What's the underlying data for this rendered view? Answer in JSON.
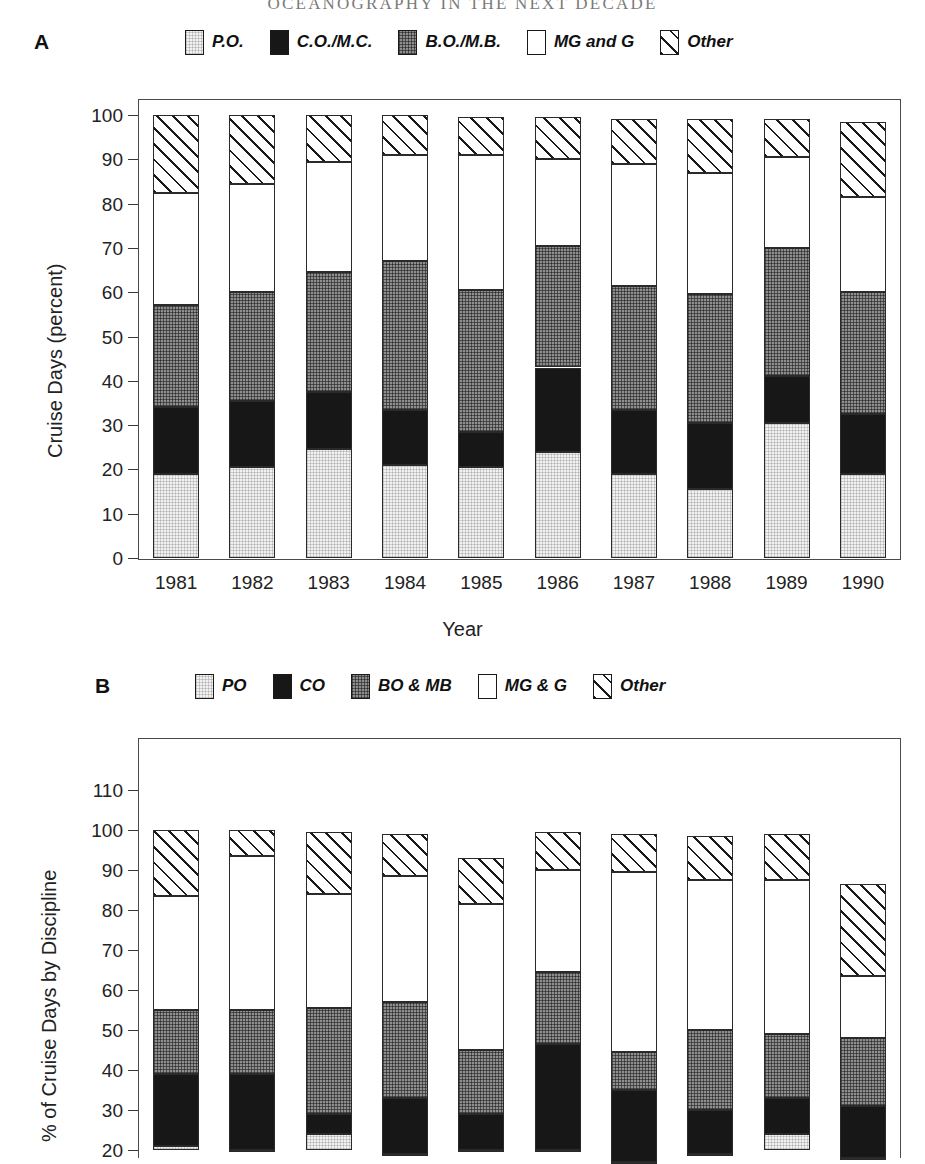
{
  "running_head": "OCEANOGRAPHY IN THE NEXT DECADE",
  "panels": [
    {
      "letter": "A",
      "legend": [
        {
          "label": "P.O.",
          "fill": "po"
        },
        {
          "label": "C.O./M.C.",
          "fill": "co"
        },
        {
          "label": "B.O./M.B.",
          "fill": "bomb"
        },
        {
          "label": "MG and G",
          "fill": "mgg"
        },
        {
          "label": "Other",
          "fill": "other"
        }
      ],
      "ylabel": "Cruise Days (percent)",
      "xlabel": "Year",
      "chart_data": {
        "type": "bar",
        "subtype": "stacked",
        "title": "",
        "xlabel": "Year",
        "ylabel": "Cruise Days (percent)",
        "ylim": [
          0,
          100
        ],
        "yticks": [
          0,
          10,
          20,
          30,
          40,
          50,
          60,
          70,
          80,
          90,
          100
        ],
        "grid": false,
        "legend_position": "top",
        "categories": [
          "1981",
          "1982",
          "1983",
          "1984",
          "1985",
          "1986",
          "1987",
          "1988",
          "1989",
          "1990"
        ],
        "series": [
          {
            "name": "P.O.",
            "values": [
              19.0,
              20.5,
              24.5,
              21.0,
              20.5,
              24.0,
              19.0,
              15.5,
              30.5,
              19.0
            ]
          },
          {
            "name": "C.O./M.C.",
            "values": [
              15.0,
              15.0,
              13.0,
              12.5,
              8.0,
              19.0,
              14.5,
              15.0,
              10.5,
              13.5
            ]
          },
          {
            "name": "B.O./M.B.",
            "values": [
              23.0,
              24.5,
              27.0,
              33.5,
              32.0,
              27.5,
              28.0,
              29.0,
              29.0,
              27.5
            ]
          },
          {
            "name": "MG and G",
            "values": [
              25.5,
              24.5,
              25.0,
              24.0,
              30.5,
              19.5,
              27.5,
              27.5,
              20.5,
              21.5
            ]
          },
          {
            "name": "Other",
            "values": [
              17.5,
              15.5,
              10.5,
              9.0,
              8.5,
              9.5,
              10.0,
              12.0,
              8.5,
              17.0
            ]
          }
        ],
        "cumulative_tops": {
          "1981": [
            19.0,
            34.0,
            57.0,
            82.5,
            100.0
          ],
          "1982": [
            20.5,
            35.5,
            60.0,
            84.5,
            100.0
          ],
          "1983": [
            24.5,
            37.5,
            64.5,
            89.5,
            100.0
          ],
          "1984": [
            21.0,
            33.5,
            67.0,
            91.0,
            100.0
          ],
          "1985": [
            20.5,
            28.5,
            60.5,
            91.0,
            99.5
          ],
          "1986": [
            24.0,
            43.0,
            70.5,
            90.0,
            99.5
          ],
          "1987": [
            19.0,
            33.5,
            61.5,
            89.0,
            99.0
          ],
          "1988": [
            15.5,
            30.5,
            59.5,
            87.0,
            99.0
          ],
          "1989": [
            30.5,
            41.0,
            70.0,
            90.5,
            99.0
          ],
          "1990": [
            19.0,
            32.5,
            60.0,
            81.5,
            98.5
          ]
        }
      }
    },
    {
      "letter": "B",
      "legend": [
        {
          "label": "PO",
          "fill": "po"
        },
        {
          "label": "CO",
          "fill": "co"
        },
        {
          "label": "BO & MB",
          "fill": "bomb"
        },
        {
          "label": "MG & G",
          "fill": "mgg"
        },
        {
          "label": "Other",
          "fill": "other"
        }
      ],
      "ylabel": "% of Cruise Days by Discipline",
      "xlabel": "",
      "chart_data": {
        "type": "bar",
        "subtype": "stacked",
        "title": "",
        "xlabel": "",
        "ylabel": "% of Cruise Days by Discipline",
        "ylim": [
          20,
          110
        ],
        "yticks": [
          20,
          30,
          40,
          50,
          60,
          70,
          80,
          90,
          100,
          110
        ],
        "grid": false,
        "legend_position": "top",
        "note": "lower portion of panel cropped by image edge at y=20",
        "categories": [
          "1",
          "2",
          "3",
          "4",
          "5",
          "6",
          "7",
          "8",
          "9",
          "10"
        ],
        "series": [
          {
            "name": "PO",
            "values": [
              21.0,
              20.0,
              24.0,
              19.0,
              20.0,
              20.0,
              17.0,
              19.0,
              24.0,
              18.0
            ]
          },
          {
            "name": "CO",
            "values": [
              18.0,
              19.0,
              5.0,
              14.0,
              9.0,
              26.5,
              18.0,
              11.0,
              9.0,
              13.0
            ]
          },
          {
            "name": "BO & MB",
            "values": [
              16.0,
              16.0,
              26.5,
              24.0,
              16.0,
              18.0,
              9.5,
              20.0,
              16.0,
              17.0
            ]
          },
          {
            "name": "MG & G",
            "values": [
              28.5,
              38.5,
              28.5,
              31.5,
              36.5,
              25.5,
              45.0,
              37.5,
              38.5,
              15.5
            ]
          },
          {
            "name": "Other",
            "values": [
              16.5,
              6.5,
              15.5,
              10.5,
              11.5,
              9.5,
              9.5,
              11.0,
              11.5,
              23.0
            ]
          }
        ],
        "cumulative_tops": {
          "b1": [
            21.0,
            39.0,
            55.0,
            83.5,
            100.0
          ],
          "b2": [
            20.0,
            39.0,
            55.0,
            93.5,
            100.0
          ],
          "b3": [
            24.0,
            29.0,
            55.5,
            84.0,
            99.5
          ],
          "b4": [
            19.0,
            33.0,
            57.0,
            88.5,
            99.0
          ],
          "b5": [
            20.0,
            29.0,
            45.0,
            81.5,
            93.0
          ],
          "b6": [
            20.0,
            46.5,
            64.5,
            90.0,
            99.5
          ],
          "b7": [
            17.0,
            35.0,
            44.5,
            89.5,
            99.0
          ],
          "b8": [
            19.0,
            30.0,
            50.0,
            87.5,
            98.5
          ],
          "b9": [
            24.0,
            33.0,
            49.0,
            87.5,
            99.0
          ],
          "b10": [
            18.0,
            31.0,
            48.0,
            63.5,
            86.5
          ]
        }
      }
    }
  ]
}
